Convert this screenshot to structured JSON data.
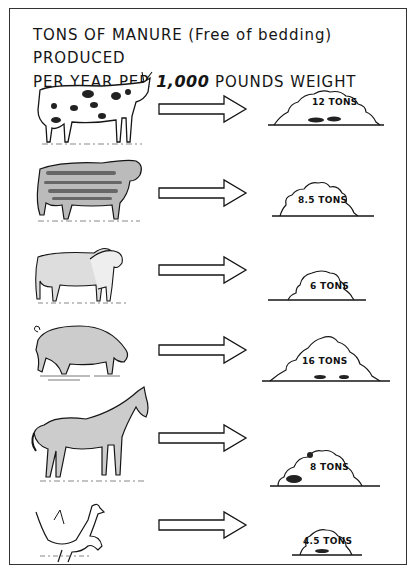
{
  "title": {
    "line1": "TONS OF MANURE (Free of bedding) PRODUCED",
    "line2_prefix": "PER YEAR PER ",
    "line2_number": "1,000",
    "line2_suffix": " POUNDS WEIGHT"
  },
  "rows": [
    {
      "animal": "Dairy cow",
      "icon": "cow-icon",
      "label": "12 TONS",
      "tons": 12
    },
    {
      "animal": "Beef cattle",
      "icon": "steer-icon",
      "label": "8.5 TONS",
      "tons": 8.5
    },
    {
      "animal": "Sheep",
      "icon": "sheep-icon",
      "label": "6 TONS",
      "tons": 6
    },
    {
      "animal": "Hog",
      "icon": "pig-icon",
      "label": "16 TONS",
      "tons": 16
    },
    {
      "animal": "Horse",
      "icon": "horse-icon",
      "label": "8 TONS",
      "tons": 8
    },
    {
      "animal": "Poultry",
      "icon": "chicken-icon",
      "label": "4.5 TONS",
      "tons": 4.5
    }
  ],
  "colors": {
    "ink": "#151515",
    "paper": "#ffffff"
  }
}
